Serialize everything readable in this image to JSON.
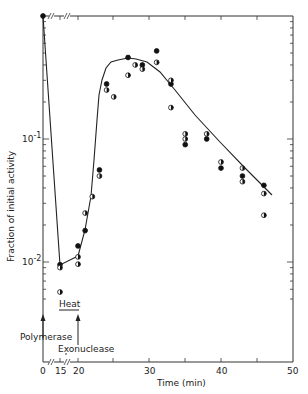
{
  "chart_data": {
    "type": "scatter",
    "title": "",
    "xlabel": "Time (min)",
    "ylabel": "Fraction of initial activity",
    "yscale": "log",
    "ylim": [
      0.0045,
      1.0
    ],
    "xlim": [
      0,
      50
    ],
    "x_axis_break": "0 // 15 // 20 (broken axis)",
    "x_ticks": [
      "0",
      "15",
      "20",
      "30",
      "40",
      "50"
    ],
    "y_ticks": [
      "10^-1",
      "10^-2"
    ],
    "grid": false,
    "annotations": [
      {
        "text": "Polymerase",
        "at_time": 0,
        "type": "arrow-up"
      },
      {
        "text": "Heat",
        "span": [
          15,
          20
        ],
        "type": "underline-bar"
      },
      {
        "text": "Exonuclease",
        "at_time": 20,
        "type": "arrow-up"
      }
    ],
    "series": [
      {
        "name": "filled circles",
        "marker": "filled",
        "points": [
          [
            0,
            1.0
          ],
          [
            15,
            0.0095
          ],
          [
            20,
            0.0135
          ],
          [
            21,
            0.018
          ],
          [
            23,
            0.056
          ],
          [
            24,
            0.28
          ],
          [
            27,
            0.46
          ],
          [
            29,
            0.4
          ],
          [
            31,
            0.52
          ],
          [
            33,
            0.28
          ],
          [
            35,
            0.09
          ],
          [
            38,
            0.1
          ],
          [
            40,
            0.058
          ],
          [
            43,
            0.05
          ],
          [
            46,
            0.042
          ]
        ]
      },
      {
        "name": "half-filled circles",
        "marker": "half",
        "points": [
          [
            15,
            0.009
          ],
          [
            15,
            0.0057
          ],
          [
            20,
            0.011
          ],
          [
            20,
            0.0096
          ],
          [
            21,
            0.025
          ],
          [
            22,
            0.034
          ],
          [
            23,
            0.05
          ],
          [
            24,
            0.25
          ],
          [
            25,
            0.22
          ],
          [
            27,
            0.33
          ],
          [
            28,
            0.4
          ],
          [
            29,
            0.37
          ],
          [
            31,
            0.42
          ],
          [
            33,
            0.3
          ],
          [
            33,
            0.18
          ],
          [
            35,
            0.11
          ],
          [
            35,
            0.1
          ],
          [
            38,
            0.11
          ],
          [
            40,
            0.065
          ],
          [
            43,
            0.058
          ],
          [
            43,
            0.045
          ],
          [
            46,
            0.036
          ],
          [
            46,
            0.024
          ]
        ]
      }
    ],
    "curve": {
      "description": "fitted line: sharp drop 0→15, connector 15→20, rise to peak ~0.4 at ~29 min, log-linear decay to ~0.025 at 47 min",
      "points": [
        [
          0,
          1.0
        ],
        [
          15,
          0.0095
        ],
        [
          20,
          0.012
        ],
        [
          22,
          0.03
        ],
        [
          24,
          0.12
        ],
        [
          25,
          0.22
        ],
        [
          26,
          0.3
        ],
        [
          27,
          0.36
        ],
        [
          28,
          0.39
        ],
        [
          29,
          0.4
        ],
        [
          30,
          0.38
        ],
        [
          32,
          0.31
        ],
        [
          35,
          0.19
        ],
        [
          38,
          0.115
        ],
        [
          41,
          0.07
        ],
        [
          44,
          0.042
        ],
        [
          47,
          0.025
        ]
      ]
    }
  },
  "labels": {
    "ylabel": "Fraction of initial activity",
    "xlabel": "Time (min)",
    "ytick_1": "10",
    "ytick_1_exp": "-1",
    "ytick_2": "10",
    "ytick_2_exp": "-2",
    "xtick_0": "0",
    "xtick_15": "15",
    "xtick_20": "20",
    "xtick_30": "30",
    "xtick_40": "40",
    "xtick_50": "50",
    "polymerase": "Polymerase",
    "heat": "Heat",
    "exonuclease": "Exonuclease"
  }
}
